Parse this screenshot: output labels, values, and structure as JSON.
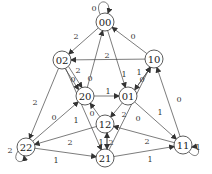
{
  "diagram": {
    "type": "state-transition-graph",
    "nodes": [
      {
        "id": "00",
        "x": 105,
        "y": 22
      },
      {
        "id": "02",
        "x": 62,
        "y": 60
      },
      {
        "id": "10",
        "x": 154,
        "y": 59
      },
      {
        "id": "20",
        "x": 85,
        "y": 96
      },
      {
        "id": "01",
        "x": 128,
        "y": 96
      },
      {
        "id": "12",
        "x": 105,
        "y": 124
      },
      {
        "id": "22",
        "x": 26,
        "y": 147
      },
      {
        "id": "21",
        "x": 105,
        "y": 158
      },
      {
        "id": "11",
        "x": 183,
        "y": 145
      }
    ],
    "edges": [
      {
        "from": "00",
        "to": "02",
        "label": "2",
        "lx": 76,
        "ly": 36
      },
      {
        "from": "10",
        "to": "00",
        "label": "0",
        "lx": 133,
        "ly": 36
      },
      {
        "from": "10",
        "to": "02",
        "label": "2",
        "lx": 107,
        "ly": 55
      },
      {
        "from": "02",
        "to": "20",
        "label": "2",
        "lx": 78,
        "ly": 70
      },
      {
        "from": "02",
        "to": "20",
        "label": "0",
        "lx": 73,
        "ly": 79
      },
      {
        "from": "20",
        "to": "00",
        "label": "0",
        "lx": 90,
        "ly": 78
      },
      {
        "from": "00",
        "to": "01",
        "label": "1",
        "lx": 124,
        "ly": 74
      },
      {
        "from": "10",
        "to": "01",
        "label": "1",
        "lx": 139,
        "ly": 72
      },
      {
        "from": "01",
        "to": "10",
        "label": "0",
        "lx": 142,
        "ly": 79
      },
      {
        "from": "20",
        "to": "01",
        "label": "1",
        "lx": 108,
        "ly": 91
      },
      {
        "from": "01",
        "to": "12",
        "label": "2",
        "lx": 124,
        "ly": 114
      },
      {
        "from": "21",
        "to": "10",
        "label": "0",
        "lx": 138,
        "ly": 118
      },
      {
        "from": "01",
        "to": "11",
        "label": "1",
        "lx": 160,
        "ly": 112
      },
      {
        "from": "11",
        "to": "10",
        "label": "0",
        "lx": 179,
        "ly": 99
      },
      {
        "from": "02",
        "to": "22",
        "label": "2",
        "lx": 35,
        "ly": 102
      },
      {
        "from": "22",
        "to": "20",
        "label": "0",
        "lx": 54,
        "ly": 117
      },
      {
        "from": "02",
        "to": "21",
        "label": "1",
        "lx": 76,
        "ly": 120
      },
      {
        "from": "12",
        "to": "20",
        "label": "0",
        "lx": 92,
        "ly": 113
      },
      {
        "from": "12",
        "to": "22",
        "label": "2",
        "lx": 70,
        "ly": 142
      },
      {
        "from": "12",
        "to": "21",
        "label": "1",
        "lx": 101,
        "ly": 142
      },
      {
        "from": "21",
        "to": "12",
        "label": "2",
        "lx": 111,
        "ly": 142
      },
      {
        "from": "22",
        "to": "21",
        "label": "1",
        "lx": 56,
        "ly": 160
      },
      {
        "from": "11",
        "to": "12",
        "label": "2",
        "lx": 147,
        "ly": 141
      },
      {
        "from": "21",
        "to": "11",
        "label": "1",
        "lx": 150,
        "ly": 159
      }
    ],
    "self_loops": [
      {
        "node": "00",
        "label": "0",
        "lx": 94,
        "ly": 8
      },
      {
        "node": "22",
        "label": "2",
        "lx": 10,
        "ly": 150
      },
      {
        "node": "11",
        "label": "1",
        "lx": 198,
        "ly": 147
      }
    ]
  }
}
